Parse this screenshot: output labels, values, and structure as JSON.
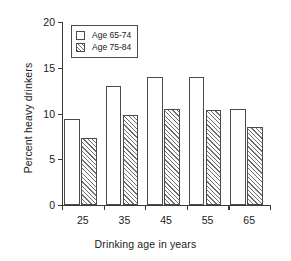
{
  "chart_data": {
    "type": "bar",
    "title": "",
    "xlabel": "Drinking age in years",
    "ylabel": "Percent heavy drinkers",
    "categories": [
      "25",
      "35",
      "45",
      "55",
      "65"
    ],
    "series": [
      {
        "name": "Age 65-74",
        "fill": "plain",
        "values": [
          9.4,
          13.0,
          14.0,
          14.0,
          10.5
        ]
      },
      {
        "name": "Age 75-84",
        "fill": "hatch",
        "values": [
          7.3,
          9.8,
          10.5,
          10.4,
          8.5
        ]
      }
    ],
    "ylim": [
      0,
      20
    ],
    "yticks": [
      0,
      5,
      10,
      15,
      20
    ],
    "ytick_labels": [
      "0",
      "5",
      "10",
      "15",
      "20"
    ],
    "grid": false,
    "legend_position": "upper-left-inside",
    "axis_color": "#3a3a3a",
    "bar_edge_color": "#4a4a4a",
    "hatch_color": "#6e6e6e",
    "background": "#ffffff"
  },
  "legend": {
    "items": [
      {
        "label": "Age 65-74"
      },
      {
        "label": "Age 75-84"
      }
    ]
  }
}
